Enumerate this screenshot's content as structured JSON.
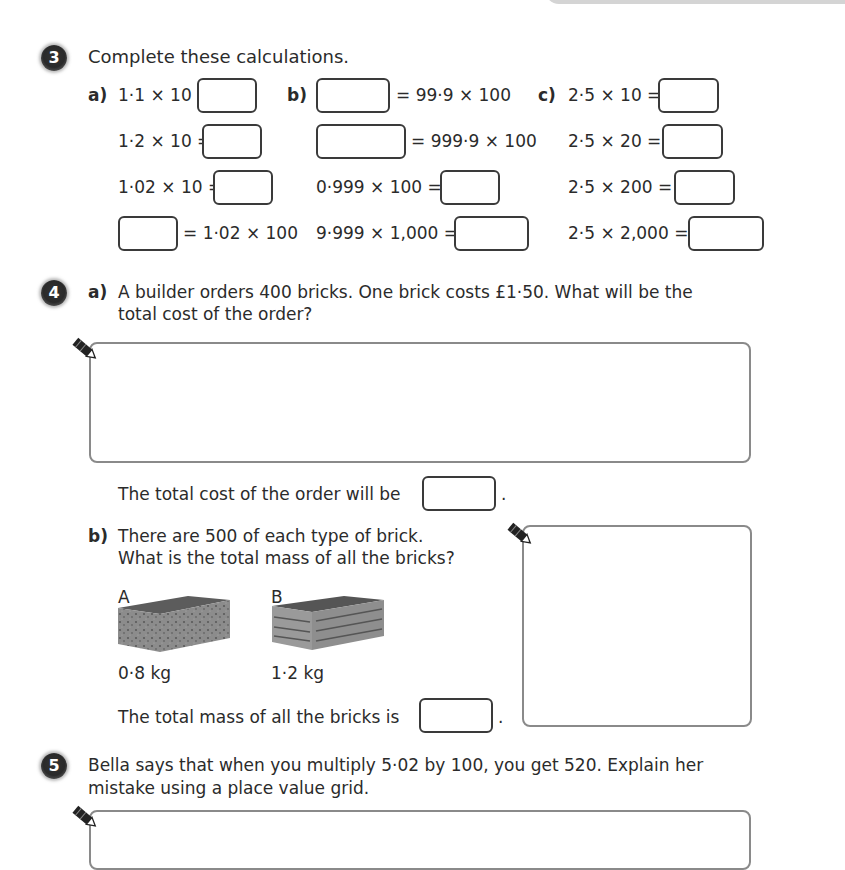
{
  "q3": {
    "number": "3",
    "prompt": "Complete these calculations.",
    "a": {
      "label": "a)",
      "rows": [
        "1·1 × 10 =",
        "1·2 × 10 =",
        "1·02 × 10 =",
        "= 1·02 × 100"
      ]
    },
    "b": {
      "label": "b)",
      "rows": [
        "= 99·9 × 100",
        "= 999·9 × 100",
        "0·999 × 100 =",
        "9·999 × 1,000 ="
      ]
    },
    "c": {
      "label": "c)",
      "rows": [
        "2·5 × 10 =",
        "2·5 × 20 =",
        "2·5 × 200 =",
        "2·5 × 2,000 ="
      ]
    }
  },
  "q4": {
    "number": "4",
    "a": {
      "label": "a)",
      "line1": "A builder orders 400 bricks. One brick costs £1·50. What will be the",
      "line2": "total cost of the order?",
      "answer_sentence": "The total cost of the order will be",
      "period": "."
    },
    "b": {
      "label": "b)",
      "line1": "There are 500 of each type of brick.",
      "line2": "What is the total mass of all the bricks?",
      "bricks": [
        {
          "name": "A",
          "mass": "0·8 kg"
        },
        {
          "name": "B",
          "mass": "1·2 kg"
        }
      ],
      "answer_sentence": "The total mass of all the bricks is",
      "period": "."
    }
  },
  "q5": {
    "number": "5",
    "line1": "Bella says that when you multiply 5·02 by 100, you get 520. Explain her",
    "line2": "mistake using a place value grid."
  }
}
